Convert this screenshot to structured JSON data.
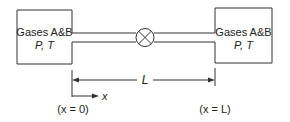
{
  "diagram": {
    "left_box": {
      "line1": "Gases A&B",
      "line2": "P, T"
    },
    "right_box": {
      "line1": "Gases A&B",
      "line2": "P, T"
    },
    "valve": "valve-symbol",
    "dimension_label": "L",
    "axis_label": "x",
    "left_position_label": "(x = 0)",
    "right_position_label": "(x = L)"
  }
}
